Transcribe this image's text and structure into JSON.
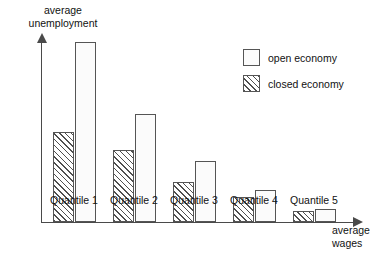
{
  "chart_data": {
    "type": "bar",
    "title": "",
    "xlabel": "average wages",
    "ylabel": "average unemployment",
    "categories": [
      "Quantile 1",
      "Quantile 2",
      "Quantile 3",
      "Quantile 4",
      "Quantile 5"
    ],
    "grid": false,
    "legend_position": "top-right",
    "axis_style": "arrow-axes, unlabeled ticks",
    "ylim": [
      0,
      100
    ],
    "series": [
      {
        "name": "closed economy",
        "pattern": "diagonal-hatch",
        "values": [
          50,
          40,
          22,
          14,
          6
        ]
      },
      {
        "name": "open economy",
        "pattern": "dotted-stipple",
        "values": [
          100,
          60,
          34,
          18,
          7
        ]
      }
    ],
    "series_order_in_group": [
      "closed economy",
      "open economy"
    ]
  },
  "axes": {
    "y_label": "average\nunemployment",
    "x_label": "average\nwages"
  },
  "legend": {
    "items": [
      {
        "label": "open economy",
        "pattern": "dotted-stipple"
      },
      {
        "label": "closed economy",
        "pattern": "diagonal-hatch"
      }
    ]
  },
  "colors": {
    "axis": "#4a4a4a",
    "bar_outline": "#555555",
    "pattern_ink": "#5c5c5c",
    "background": "#ffffff",
    "text": "#111111"
  }
}
